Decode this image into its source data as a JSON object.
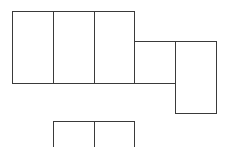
{
  "diagram": {
    "type": "box-net",
    "stroke_color": "#3a3a3a",
    "background": "#ffffff",
    "cells": [
      {
        "id": "top-row-cell-1",
        "x": 12,
        "y": 11,
        "w": 42,
        "h": 73
      },
      {
        "id": "top-row-cell-2",
        "x": 53,
        "y": 11,
        "w": 42,
        "h": 73
      },
      {
        "id": "top-row-cell-3",
        "x": 94,
        "y": 11,
        "w": 41,
        "h": 73
      },
      {
        "id": "middle-square-cell",
        "x": 134,
        "y": 41,
        "w": 42,
        "h": 43
      },
      {
        "id": "tall-right-cell",
        "x": 175,
        "y": 41,
        "w": 42,
        "h": 73
      },
      {
        "id": "bottom-cell-1",
        "x": 53,
        "y": 121,
        "w": 42,
        "h": 30
      },
      {
        "id": "bottom-cell-2",
        "x": 94,
        "y": 121,
        "w": 41,
        "h": 30
      }
    ]
  }
}
